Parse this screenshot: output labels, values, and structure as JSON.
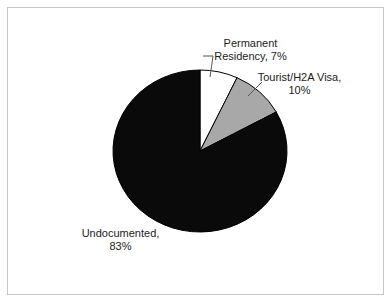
{
  "canvas": {
    "background": "#ffffff",
    "border_color": "#c7c7c7"
  },
  "chart_data": {
    "type": "pie",
    "title": "",
    "start_angle_deg": 0,
    "direction": "clockwise",
    "legend": "none",
    "outline_color": "#000000",
    "slices": [
      {
        "label": "Permanent Residency",
        "value_pct": 7,
        "color": "#ffffff"
      },
      {
        "label": "Tourist/H2A Visa",
        "value_pct": 10,
        "color": "#a8a8a8"
      },
      {
        "label": "Undocumented",
        "value_pct": 83,
        "color": "#0a0a0a"
      }
    ],
    "callouts": {
      "permanent": {
        "line1": "Permanent",
        "line2": "Residency, 7%"
      },
      "tourist": {
        "line1": "Tourist/H2A Visa,",
        "line2": "10%"
      },
      "undocumented": {
        "line1": "Undocumented,",
        "line2": "83%"
      }
    }
  }
}
